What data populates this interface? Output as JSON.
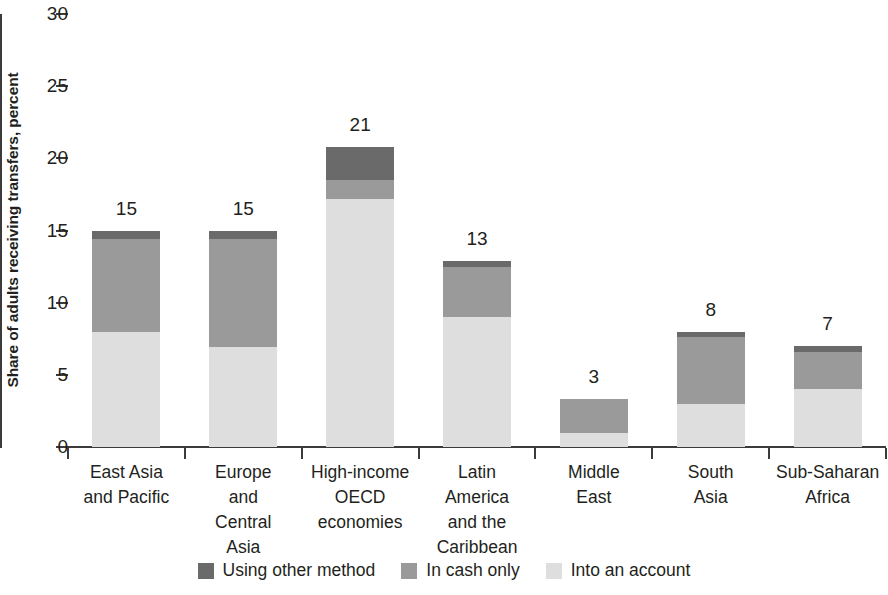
{
  "chart_data": {
    "type": "bar",
    "stacked": true,
    "title": "",
    "xlabel": "",
    "ylabel": "Share of adults receiving transfers, percent",
    "ylim": [
      0,
      30
    ],
    "yticks": [
      0,
      5,
      10,
      15,
      20,
      25,
      30
    ],
    "ytick_labels": [
      "0",
      "5",
      "10",
      "15",
      "20",
      "25",
      "30"
    ],
    "grid": false,
    "legend_position": "bottom",
    "categories": [
      "East Asia and Pacific",
      "Europe and Central Asia",
      "High-income OECD economies",
      "Latin America and the Caribbean",
      "Middle East",
      "South Asia",
      "Sub-Saharan Africa"
    ],
    "category_lines": [
      [
        "East Asia",
        "and Pacific"
      ],
      [
        "Europe",
        "and",
        "Central",
        "Asia"
      ],
      [
        "High-income",
        "OECD",
        "economies"
      ],
      [
        "Latin",
        "America",
        "and the",
        "Caribbean"
      ],
      [
        "Middle",
        "East"
      ],
      [
        "South",
        "Asia"
      ],
      [
        "Sub-Saharan",
        "Africa"
      ]
    ],
    "series": [
      {
        "name": "Into an account",
        "color": "#dedede",
        "values": [
          8.0,
          6.9,
          17.2,
          9.0,
          1.0,
          3.0,
          4.0
        ]
      },
      {
        "name": "In cash only",
        "color": "#9a9a9a",
        "values": [
          6.4,
          7.5,
          1.3,
          3.5,
          2.3,
          4.6,
          2.6
        ]
      },
      {
        "name": "Using other method",
        "color": "#6a6a6a",
        "values": [
          0.6,
          0.6,
          2.3,
          0.4,
          0.0,
          0.4,
          0.4
        ]
      }
    ],
    "totals": [
      15,
      15,
      21,
      13,
      3,
      8,
      7
    ],
    "total_labels": [
      "15",
      "15",
      "21",
      "13",
      "3",
      "8",
      "7"
    ],
    "legend": [
      {
        "label": "Using other method",
        "color": "#6a6a6a"
      },
      {
        "label": "In cash only",
        "color": "#9a9a9a"
      },
      {
        "label": "Into an account",
        "color": "#dedede"
      }
    ]
  }
}
